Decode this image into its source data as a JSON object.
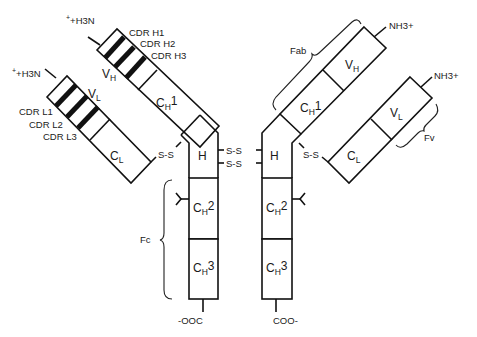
{
  "figure": {
    "type": "antibody-structure-diagram",
    "left_heavy_chain": {
      "terminus": "+H3N",
      "cdr_labels": [
        "CDR H1",
        "CDR H2",
        "CDR H3"
      ],
      "domains": [
        "VH",
        "CH1"
      ]
    },
    "left_light_chain": {
      "terminus": "+H3N",
      "cdr_labels": [
        "CDR L1",
        "CDR L2",
        "CDR L3"
      ],
      "domains": [
        "VL",
        "CL"
      ]
    },
    "right_heavy_chain": {
      "terminus": "NH3+",
      "domains": [
        "VH",
        "CH1"
      ]
    },
    "right_light_chain": {
      "terminus": "NH3+",
      "domains": [
        "VL",
        "CL"
      ]
    },
    "hinge_label": "H",
    "disulfide_label": "S-S",
    "fc_domains": [
      "CH2",
      "CH3"
    ],
    "c_terminus_left": "-OOC",
    "c_terminus_right": "COO-",
    "region_labels": {
      "fab": "Fab",
      "fv": "Fv",
      "fc": "Fc"
    }
  }
}
